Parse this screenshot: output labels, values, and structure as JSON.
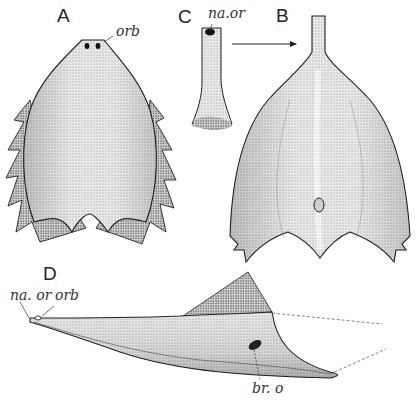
{
  "figure": {
    "panels": [
      {
        "id": "A",
        "letter": "A",
        "description": "dorsal view of shield with marginal spines"
      },
      {
        "id": "B",
        "letter": "B",
        "description": "ventral/dorsal shield with rostral tube and branchial opening"
      },
      {
        "id": "C",
        "letter": "C",
        "description": "detached rostral tube"
      },
      {
        "id": "D",
        "letter": "D",
        "description": "lateral view of shield"
      }
    ],
    "labels": {
      "a_orb": "orb",
      "c_na_or": "na.or",
      "d_na_or": "na. or",
      "d_orb": "orb",
      "d_br_o": "br. o"
    },
    "arrow": {
      "from": "C",
      "to": "B"
    },
    "colors": {
      "ink": "#222222",
      "stipple": "#9a9a9a",
      "fill_light": "#e4e4e4",
      "fill_mid": "#cfcfcf",
      "background": "#ffffff"
    }
  }
}
